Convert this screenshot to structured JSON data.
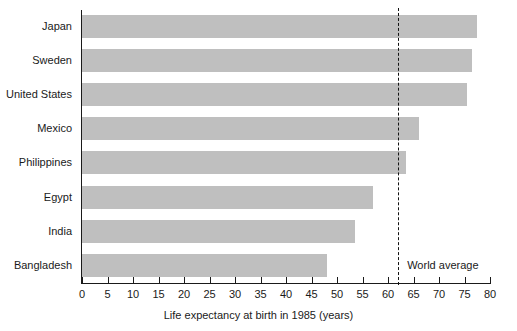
{
  "chart_data": {
    "type": "bar",
    "orientation": "horizontal",
    "title": "",
    "xlabel": "Life expectancy at birth in 1985 (years)",
    "ylabel": "",
    "xlim": [
      0,
      80
    ],
    "xticks": [
      0,
      5,
      10,
      15,
      20,
      25,
      30,
      35,
      40,
      45,
      50,
      55,
      60,
      65,
      70,
      75,
      80
    ],
    "grid": false,
    "legend": "none",
    "bar_color": "#bfbfbf",
    "axis_color": "#1a1a1a",
    "categories": [
      "Japan",
      "Sweden",
      "United States",
      "Mexico",
      "Philippines",
      "Egypt",
      "India",
      "Bangladesh"
    ],
    "values": [
      77.5,
      76.5,
      75.5,
      66,
      63.5,
      57,
      53.5,
      48
    ],
    "annotations": [
      {
        "name": "world-average",
        "label": "World average",
        "value": 62,
        "style": "dashed-vertical-line"
      }
    ]
  },
  "axis": {
    "x_title": "Life expectancy at birth in 1985 (years)",
    "tick_labels": [
      "0",
      "5",
      "10",
      "15",
      "20",
      "25",
      "30",
      "35",
      "40",
      "45",
      "50",
      "55",
      "60",
      "65",
      "70",
      "75",
      "80"
    ]
  },
  "bars": [
    {
      "label": "Japan",
      "value": 77.5
    },
    {
      "label": "Sweden",
      "value": 76.5
    },
    {
      "label": "United States",
      "value": 75.5
    },
    {
      "label": "Mexico",
      "value": 66
    },
    {
      "label": "Philippines",
      "value": 63.5
    },
    {
      "label": "Egypt",
      "value": 57
    },
    {
      "label": "India",
      "value": 53.5
    },
    {
      "label": "Bangladesh",
      "value": 48
    }
  ],
  "world_average": {
    "label": "World average",
    "value": 62
  }
}
